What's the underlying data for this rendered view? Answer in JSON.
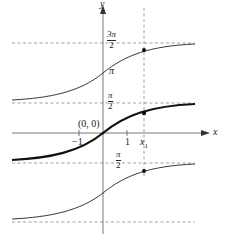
{
  "axes": {
    "x_label": "x",
    "y_label": "y",
    "origin_label": "(0, 0)",
    "ticks": {
      "neg_one": "−1",
      "one": "1",
      "x1": "x",
      "x1_sub": "1"
    }
  },
  "asymptotes": [
    {
      "name": "three-pi-over-two",
      "num": "3π",
      "den": "2"
    },
    {
      "name": "pi-over-two",
      "num": "π",
      "den": "2"
    },
    {
      "name": "neg-pi-over-two",
      "num": "π",
      "den": "2"
    },
    {
      "name": "neg-three-pi-over-two",
      "num": "",
      "den": ""
    }
  ],
  "branch_labels": {
    "pi": "π"
  },
  "colors": {
    "curve": "#111111",
    "axis": "#555555",
    "dashed": "#777777"
  }
}
